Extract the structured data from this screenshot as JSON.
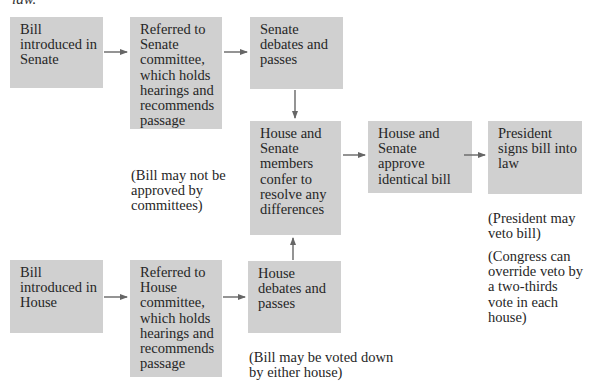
{
  "header": {
    "cut_text": "law."
  },
  "boxes": {
    "senate_intro": "Bill\nintroduced in\nSenate",
    "senate_committee": "Referred to\nSenate\ncommittee,\nwhich holds\nhearings and\nrecommends\npassage",
    "senate_debate": "Senate\ndebates and\npasses",
    "conference": "House and\nSenate\nmembers\nconfer to\nresolve any\ndifferences",
    "approve": "House and\nSenate\napprove\nidentical bill",
    "president": "President\nsigns bill into\nlaw",
    "house_intro": "Bill\nintroduced in\nHouse",
    "house_committee": "Referred to\nHouse\ncommittee,\nwhich holds\nhearings and\nrecommends\npassage",
    "house_debate": "House\ndebates and\npasses"
  },
  "notes": {
    "committees": "(Bill may not be\napproved by\ncommittees)",
    "veto": "(President may\nveto bill)",
    "override": "(Congress can\noverride veto by\na two-thirds\nvote in each\nhouse)",
    "voted_down": "(Bill may be voted down\nby either house)"
  },
  "colors": {
    "box_fill": "#d0d0d0",
    "arrow": "#666666",
    "text": "#262626"
  }
}
